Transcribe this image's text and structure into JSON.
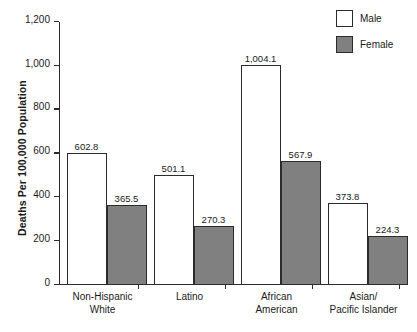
{
  "chart_data": {
    "type": "bar",
    "title": "",
    "subtitle": "",
    "xlabel": "",
    "ylabel": "Deaths Per 100,000 Population",
    "ylim": [
      0,
      1200
    ],
    "ytick_labels": [
      "0",
      "200",
      "400",
      "600",
      "800",
      "1,000",
      "1,200"
    ],
    "ytick_values": [
      0,
      200,
      400,
      600,
      800,
      1000,
      1200
    ],
    "grid": false,
    "legend_position": "top-right",
    "categories": [
      "Non-Hispanic White",
      "Latino",
      "African American",
      "Asian/Pacific Islander"
    ],
    "category_lines": [
      [
        "Non-Hispanic",
        "White"
      ],
      [
        "Latino",
        ""
      ],
      [
        "African",
        "American"
      ],
      [
        "Asian/",
        "Pacific Islander"
      ]
    ],
    "series": [
      {
        "name": "Male",
        "color": "#ffffff",
        "values": [
          602.8,
          501.1,
          1004.1,
          373.8
        ],
        "labels": [
          "602.8",
          "501.1",
          "1,004.1",
          "373.8"
        ]
      },
      {
        "name": "Female",
        "color": "#808080",
        "values": [
          365.5,
          270.3,
          567.9,
          224.3
        ],
        "labels": [
          "365.5",
          "270.3",
          "567.9",
          "224.3"
        ]
      }
    ]
  },
  "legend": {
    "items": [
      {
        "label": "Male",
        "swatch": "white-square-swatch"
      },
      {
        "label": "Female",
        "swatch": "gray-square-swatch"
      }
    ]
  },
  "colors": {
    "male_fill": "#ffffff",
    "female_fill": "#808080",
    "axis": "#2b2b2b",
    "text": "#1a1a1a",
    "background": "#ffffff"
  }
}
